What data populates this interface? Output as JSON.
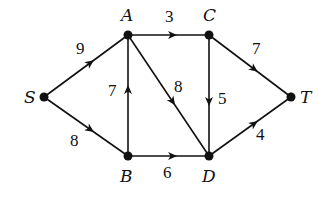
{
  "diagram": {
    "type": "directed-weighted-graph",
    "nodes": [
      {
        "id": "S",
        "label": "S",
        "x": 44,
        "y": 97,
        "lx": 24,
        "ly": 103
      },
      {
        "id": "A",
        "label": "A",
        "x": 128,
        "y": 35,
        "lx": 121,
        "ly": 21
      },
      {
        "id": "C",
        "label": "C",
        "x": 209,
        "y": 35,
        "lx": 203,
        "ly": 21
      },
      {
        "id": "T",
        "label": "T",
        "x": 291,
        "y": 97,
        "lx": 300,
        "ly": 103
      },
      {
        "id": "B",
        "label": "B",
        "x": 128,
        "y": 156,
        "lx": 120,
        "ly": 182
      },
      {
        "id": "D",
        "label": "D",
        "x": 209,
        "y": 156,
        "lx": 202,
        "ly": 182
      }
    ],
    "edges": [
      {
        "from": "S",
        "to": "A",
        "weight": "9",
        "wx": 76,
        "wy": 54
      },
      {
        "from": "S",
        "to": "B",
        "weight": "8",
        "wx": 70,
        "wy": 146
      },
      {
        "from": "B",
        "to": "A",
        "weight": "7",
        "wx": 108,
        "wy": 96
      },
      {
        "from": "A",
        "to": "C",
        "weight": "3",
        "wx": 165,
        "wy": 22
      },
      {
        "from": "A",
        "to": "D",
        "weight": "8",
        "wx": 174,
        "wy": 92
      },
      {
        "from": "C",
        "to": "D",
        "weight": "5",
        "wx": 218,
        "wy": 104
      },
      {
        "from": "C",
        "to": "T",
        "weight": "7",
        "wx": 252,
        "wy": 54
      },
      {
        "from": "B",
        "to": "D",
        "weight": "6",
        "wx": 163,
        "wy": 178
      },
      {
        "from": "D",
        "to": "T",
        "weight": "4",
        "wx": 256,
        "wy": 140
      }
    ]
  }
}
